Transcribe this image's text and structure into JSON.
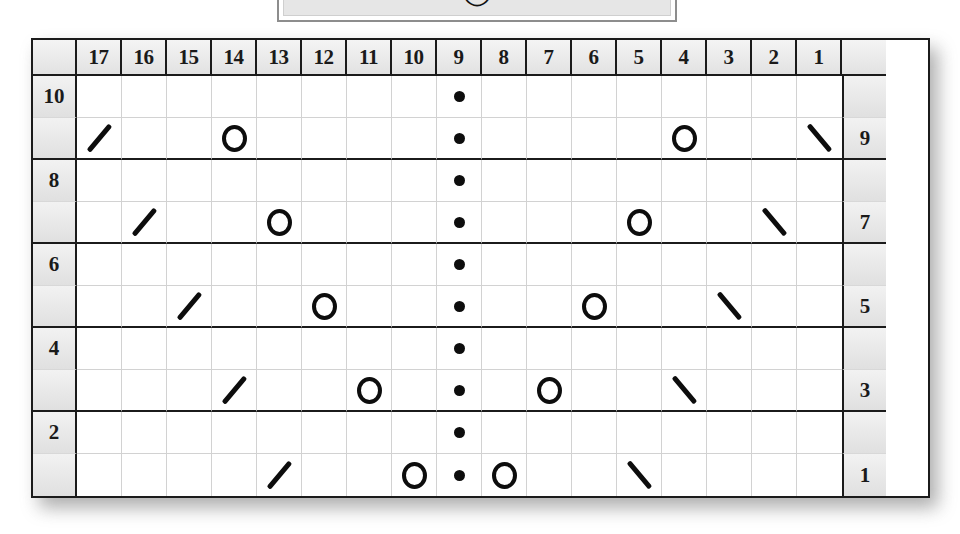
{
  "legend": {
    "name": "legend-box",
    "glyph": "◯"
  },
  "chart_data": {
    "type": "table",
    "columns": 17,
    "rows": 10,
    "column_headers": [
      "17",
      "16",
      "15",
      "14",
      "13",
      "12",
      "11",
      "10",
      "9",
      "8",
      "7",
      "6",
      "5",
      "4",
      "3",
      "2",
      "1"
    ],
    "left_row_labels": [
      "10",
      "",
      "8",
      "",
      "6",
      "",
      "4",
      "",
      "2",
      ""
    ],
    "right_row_labels": [
      "",
      "9",
      "",
      "7",
      "",
      "5",
      "",
      "3",
      "",
      "1"
    ],
    "row_order_top_to_bottom": [
      10,
      9,
      8,
      7,
      6,
      5,
      4,
      3,
      2,
      1
    ],
    "symbol_legend": {
      "dot": "purl / centre-marker dot",
      "circle": "yarn over",
      "back-slash": "left-leaning decrease",
      "forward-slash": "right-leaning decrease"
    },
    "cells": [
      {
        "row": 10,
        "symbols": [
          {
            "col": 9,
            "type": "dot"
          }
        ]
      },
      {
        "row": 9,
        "symbols": [
          {
            "col": 17,
            "type": "back-slash"
          },
          {
            "col": 14,
            "type": "circle"
          },
          {
            "col": 9,
            "type": "dot"
          },
          {
            "col": 4,
            "type": "circle"
          },
          {
            "col": 1,
            "type": "forward-slash"
          }
        ]
      },
      {
        "row": 8,
        "symbols": [
          {
            "col": 9,
            "type": "dot"
          }
        ]
      },
      {
        "row": 7,
        "symbols": [
          {
            "col": 16,
            "type": "back-slash"
          },
          {
            "col": 13,
            "type": "circle"
          },
          {
            "col": 9,
            "type": "dot"
          },
          {
            "col": 5,
            "type": "circle"
          },
          {
            "col": 2,
            "type": "forward-slash"
          }
        ]
      },
      {
        "row": 6,
        "symbols": [
          {
            "col": 9,
            "type": "dot"
          }
        ]
      },
      {
        "row": 5,
        "symbols": [
          {
            "col": 15,
            "type": "back-slash"
          },
          {
            "col": 12,
            "type": "circle"
          },
          {
            "col": 9,
            "type": "dot"
          },
          {
            "col": 6,
            "type": "circle"
          },
          {
            "col": 3,
            "type": "forward-slash"
          }
        ]
      },
      {
        "row": 4,
        "symbols": [
          {
            "col": 9,
            "type": "dot"
          }
        ]
      },
      {
        "row": 3,
        "symbols": [
          {
            "col": 14,
            "type": "back-slash"
          },
          {
            "col": 11,
            "type": "circle"
          },
          {
            "col": 9,
            "type": "dot"
          },
          {
            "col": 7,
            "type": "circle"
          },
          {
            "col": 4,
            "type": "forward-slash"
          }
        ]
      },
      {
        "row": 2,
        "symbols": [
          {
            "col": 9,
            "type": "dot"
          }
        ]
      },
      {
        "row": 1,
        "symbols": [
          {
            "col": 13,
            "type": "back-slash"
          },
          {
            "col": 10,
            "type": "circle"
          },
          {
            "col": 9,
            "type": "dot"
          },
          {
            "col": 8,
            "type": "circle"
          },
          {
            "col": 5,
            "type": "forward-slash"
          }
        ]
      }
    ]
  },
  "colors": {
    "grid_border": "#1b1b1b",
    "grid_line": "#d2d2d2",
    "header_fill": "#e9e9e9",
    "symbol": "#0d0d0d",
    "page_background": "#ffffff"
  }
}
